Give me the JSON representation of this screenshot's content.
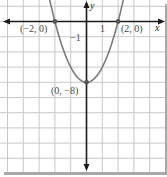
{
  "chart_data": {
    "type": "line",
    "title": "",
    "function": "y = 2x^2 - 8",
    "xlabel": "x",
    "ylabel": "y",
    "xlim": [
      -5.4,
      4.9
    ],
    "ylim": [
      -16,
      2
    ],
    "grid": true,
    "x_grid_step": 1,
    "y_grid_step": 2,
    "tick_labels": {
      "x": "1",
      "y": "-1"
    },
    "series": [
      {
        "name": "parabola",
        "x": [
          -2.5,
          -2,
          -1.5,
          -1,
          -0.5,
          0,
          0.5,
          1,
          1.5,
          2,
          2.5
        ],
        "y": [
          4.5,
          0,
          -3.5,
          -6,
          -7.5,
          -8,
          -7.5,
          -6,
          -3.5,
          0,
          4.5
        ]
      }
    ],
    "points": [
      {
        "x": -2,
        "y": 0,
        "label": "(−2, 0)"
      },
      {
        "x": 2,
        "y": 0,
        "label": "(2, 0)"
      },
      {
        "x": 0,
        "y": -8,
        "label": "(0, −8)"
      }
    ]
  },
  "labels": {
    "x_axis": "x",
    "y_axis": "y",
    "tick_x": "1",
    "tick_y": "−1",
    "point_left": "(−2, 0)",
    "point_right": "(2, 0)",
    "point_vertex": "(0, −8)"
  },
  "colors": {
    "grid": "#c8c8c8",
    "axis": "#1a1a1a",
    "curve": "#7a7a7a",
    "point": "#555555",
    "shadow": "#9a9a9a"
  }
}
